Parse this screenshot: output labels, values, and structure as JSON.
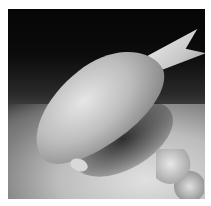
{
  "image": {
    "subject": "Large parrotfish feeding on the seafloor at night",
    "style": "black-and-white underwater photograph",
    "background_color": "#ffffff",
    "photo_bounds": {
      "left": 8,
      "top": 9,
      "width": 197,
      "height": 190
    }
  }
}
